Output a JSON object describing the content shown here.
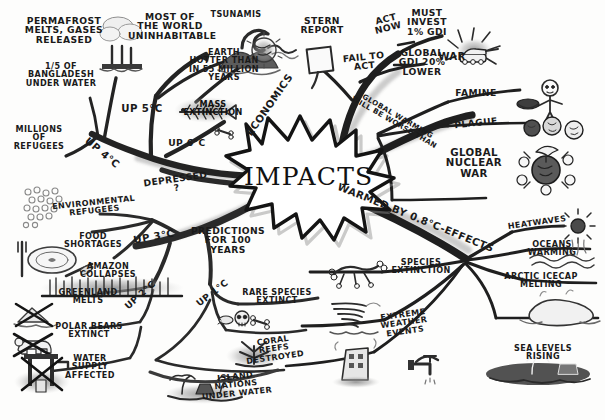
{
  "center": {
    "label": "IMPACTS",
    "shape": "starburst"
  },
  "colors": {
    "ink": "#1a1a1a",
    "paper": "#fdfdfc",
    "branch": "#2b2b2b",
    "shadow": "#bdbdbd"
  },
  "branches": [
    {
      "id": "up-6c",
      "label": "UP 6°C",
      "direction": "upper-left",
      "children": [
        {
          "label": "MASS\nEXTINCTION",
          "icon": "fish-bones-icon"
        },
        {
          "label": "EARTH\nHOTTER THAN\nIN 55 MILLION\nYEARS",
          "icon": "scorched-earth-icon"
        },
        {
          "label": "TSUNAMIS",
          "icon": "wave-icon"
        }
      ]
    },
    {
      "id": "up-5c",
      "label": "UP 5°C",
      "direction": "up",
      "children": [
        {
          "label": "MOST OF\nTHE WORLD\nUNINHABITABLE",
          "icon": "barren-mountain-icon"
        }
      ]
    },
    {
      "id": "up-4c",
      "label": "UP 4°C",
      "direction": "left",
      "children": [
        {
          "label": "PERMAFROST\nMELTS, GASES\nRELEASED",
          "icon": "gas-vent-icon"
        },
        {
          "label": "1/5 OF\nBANGLADESH\nUNDER WATER",
          "icon": "fraction-one-fifth-icon"
        },
        {
          "label": "MILLIONS\nOF\nREFUGEES",
          "icon": "refugees-icon"
        }
      ]
    },
    {
      "id": "depressed",
      "label": "DEPRESSED ?",
      "direction": "left-connector",
      "children": []
    },
    {
      "id": "predictions",
      "label": "PREDICTIONS\nFOR 100 YEARS",
      "direction": "lower-left",
      "children": [
        {
          "label": "UP 3°C",
          "children": [
            {
              "label": "ENVIRONMENTAL\nREFUGEES",
              "icon": "crowd-dots-icon"
            },
            {
              "label": "FOOD\nSHORTAGES",
              "icon": "empty-plate-icon"
            },
            {
              "label": "AMAZON\nCOLLAPSES",
              "icon": "dead-forest-icon"
            }
          ]
        },
        {
          "label": "UP 2°C",
          "children": [
            {
              "label": "GREENLAND\nMELTS",
              "icon": "crossed-iceberg-icon"
            },
            {
              "label": "POLAR BEARS\nEXTINCT",
              "icon": "crossed-polar-bear-icon"
            },
            {
              "label": "WATER SUPPLY\nAFFECTED",
              "icon": "crossed-well-icon"
            }
          ]
        },
        {
          "label": "UP 1°C",
          "children": [
            {
              "label": "RARE SPECIES\nEXTINCT",
              "icon": "skull-bones-icon"
            },
            {
              "label": "CORAL REEFS\nDESTROYED",
              "icon": "dead-coral-icon"
            },
            {
              "label": "ISLAND NATIONS\nUNDER WATER",
              "icon": "sinking-island-icon"
            }
          ]
        }
      ]
    },
    {
      "id": "warmed",
      "label": "WARMED BY 0.8°C-EFFECTS",
      "direction": "lower-right",
      "children": [
        {
          "label": "HEATWAVES",
          "icon": "blazing-sun-icon"
        },
        {
          "label": "OCEANS WARMING",
          "icon": "warm-waves-icon"
        },
        {
          "label": "ARCTIC ICECAP\nMELTING",
          "icon": "melting-icecap-icon"
        },
        {
          "label": "SEA LEVELS RISING",
          "icon": "flooded-shore-icon"
        },
        {
          "label": "SPECIES\nEXTINCTION",
          "icon": "animal-bones-icon"
        },
        {
          "label": "EXTREME\nWEATHER EVENTS",
          "icon": "tornado-icon"
        },
        {
          "label": "",
          "icon": "collapsing-building-icon"
        }
      ]
    },
    {
      "id": "economics",
      "label": "ECONOMICS",
      "direction": "upper-right",
      "children": [
        {
          "label": "STERN\nREPORT",
          "icon": "report-page-icon"
        },
        {
          "label": "ACT\nNOW",
          "children": [
            {
              "label": "MUST\nINVEST\n1% GDI"
            }
          ]
        },
        {
          "label": "FAIL TO\nACT",
          "children": [
            {
              "label": "GLOBAL\nGDI 20%\nLOWER"
            }
          ]
        }
      ]
    },
    {
      "id": "worse-than",
      "label": "GLOBAL WARMING\nWILL BE WORSE THAN",
      "direction": "right",
      "children": [
        {
          "label": "WAR",
          "icon": "tank-explosion-icon"
        },
        {
          "label": "FAMINE",
          "icon": "starving-person-icon"
        },
        {
          "label": "PLAGUE",
          "icon": "virus-cells-icon"
        },
        {
          "label": "GLOBAL\nNUCLEAR\nWAR",
          "icon": "nuclear-blast-icon"
        }
      ]
    }
  ]
}
